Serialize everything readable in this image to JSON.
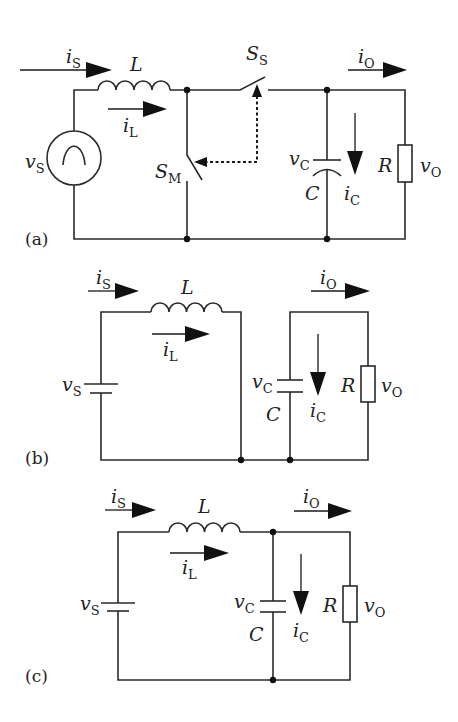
{
  "figure": {
    "panels": [
      {
        "id": "a",
        "label": "(a)",
        "labels": {
          "is": "i",
          "is_sub": "S",
          "L": "L",
          "il": "i",
          "il_sub": "L",
          "vs": "v",
          "vs_sub": "S",
          "sm": "S",
          "sm_sub": "M",
          "ss": "S",
          "ss_sub": "S",
          "io": "i",
          "io_sub": "O",
          "vc": "v",
          "vc_sub": "C",
          "C": "C",
          "ic": "i",
          "ic_sub": "C",
          "R": "R",
          "vo": "v",
          "vo_sub": "O"
        },
        "components": [
          "ac-source",
          "inductor",
          "main-switch",
          "secondary-switch",
          "capacitor",
          "resistor"
        ]
      },
      {
        "id": "b",
        "label": "(b)",
        "labels": {
          "is": "i",
          "is_sub": "S",
          "L": "L",
          "il": "i",
          "il_sub": "L",
          "vs": "v",
          "vs_sub": "S",
          "io": "i",
          "io_sub": "O",
          "vc": "v",
          "vc_sub": "C",
          "C": "C",
          "ic": "i",
          "ic_sub": "C",
          "R": "R",
          "vo": "v",
          "vo_sub": "O"
        },
        "components": [
          "dc-source",
          "inductor",
          "capacitor",
          "resistor"
        ]
      },
      {
        "id": "c",
        "label": "(c)",
        "labels": {
          "is": "i",
          "is_sub": "S",
          "L": "L",
          "il": "i",
          "il_sub": "L",
          "vs": "v",
          "vs_sub": "S",
          "io": "i",
          "io_sub": "O",
          "vc": "v",
          "vc_sub": "C",
          "C": "C",
          "ic": "i",
          "ic_sub": "C",
          "R": "R",
          "vo": "v",
          "vo_sub": "O"
        },
        "components": [
          "dc-source",
          "inductor",
          "capacitor",
          "resistor"
        ]
      }
    ]
  }
}
